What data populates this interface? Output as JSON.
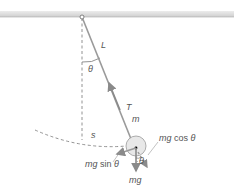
{
  "diagram": {
    "labels": {
      "length": "L",
      "angle_top": "θ",
      "tension": "T",
      "mass": "m",
      "arc": "s",
      "tangential_force_mg": "mg",
      "tangential_force_sin": " sin ",
      "tangential_force_theta": "θ",
      "radial_force_mg": "mg",
      "radial_force_cos": " cos ",
      "radial_force_theta": "θ",
      "angle_bottom": "θ",
      "weight": "mg"
    },
    "colors": {
      "ceiling": "#d8d8d8",
      "string": "#8a8a8a",
      "bob_fill": "#e6e6e6",
      "arrow": "#8a8a8a",
      "text": "#555555"
    }
  }
}
